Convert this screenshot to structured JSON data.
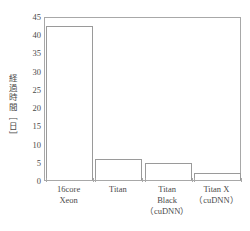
{
  "chart_data": {
    "type": "bar",
    "title": "",
    "xlabel": "",
    "ylabel": "経過時間［日］",
    "categories": [
      "16core\nXeon",
      "Titan",
      "Titan\nBlack\n（cuDNN）",
      "Titan X\n（cuDNN）"
    ],
    "category_lines": [
      [
        "16core",
        "Xeon"
      ],
      [
        "Titan"
      ],
      [
        "Titan",
        "Black",
        "（cuDNN）"
      ],
      [
        "Titan X",
        "（cuDNN）"
      ]
    ],
    "values": [
      42.3,
      5.8,
      4.6,
      1.9
    ],
    "ylim": [
      0,
      45
    ],
    "yticks": [
      0,
      5,
      10,
      15,
      20,
      25,
      30,
      35,
      40,
      45
    ],
    "ytick_labels": [
      "0",
      "5",
      "10",
      "15",
      "20",
      "25",
      "30",
      "35",
      "40",
      "45"
    ],
    "grid": false,
    "legend": null,
    "bar_fill_color": "#ffffff",
    "bar_edge_color": "#9a9a9a",
    "axis_color": "#a8a8a8",
    "text_color": "#4a4a4a"
  }
}
